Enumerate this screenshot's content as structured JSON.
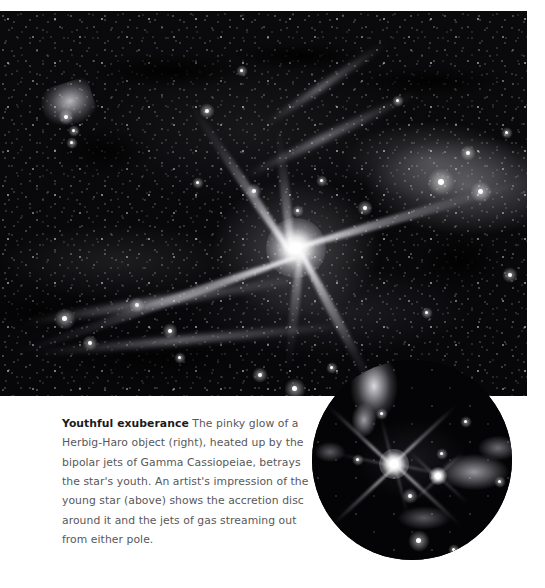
{
  "figure": {
    "kind": "astronomy-photograph-with-inset",
    "main_image": {
      "name": "herbig-haro-object-wide-field",
      "alt": "Dense star field with a brilliant central star whose light forms an X-shaped bipolar glow, surrounded by dark dust lanes and faint nebulosity",
      "palette": {
        "background": "#050507",
        "star": "#ffffff",
        "nebula": "#c8c8d0",
        "dust": "#000000"
      }
    },
    "inset_image": {
      "name": "young-star-accretion-disc-closeup",
      "shape": "circle",
      "alt": "Circular close-up of a brilliant young star with four-pointed diffraction spikes and a fainter companion, set against bright nebulosity",
      "palette": {
        "background": "#040406",
        "star": "#ffffff",
        "nebula": "#e1e1e8"
      }
    }
  },
  "caption": {
    "lead": "Youthful exuberance",
    "body": " The pinky glow of a Herbig-Haro object (right), heated up by the bipolar jets of Gamma Cassiopeiae, betrays the star's youth. An artist's impression of the young star (above) shows the accretion disc around it and the jets of gas streaming out from either pole.",
    "text_color": "#58585a",
    "lead_color": "#1b1b1d"
  },
  "page": {
    "background": "#ffffff",
    "width": 545,
    "height": 588
  }
}
